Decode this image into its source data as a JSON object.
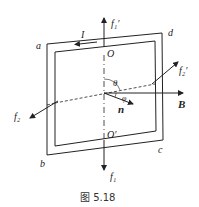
{
  "figure": {
    "caption": "图 5.18",
    "labels": {
      "corner_a": "a",
      "corner_b": "b",
      "corner_c": "c",
      "corner_d": "d",
      "current": "I",
      "axis_top": "O",
      "axis_bottom": "O′",
      "force_f1_prime": "f₁′",
      "force_f1": "f₁",
      "force_f2_prime": "f₂′",
      "force_f2": "f₂",
      "angle_theta": "θ",
      "angle_phi": "φ",
      "normal": "n",
      "field": "B"
    },
    "colors": {
      "stroke": "#222222",
      "text": "#222222"
    }
  }
}
